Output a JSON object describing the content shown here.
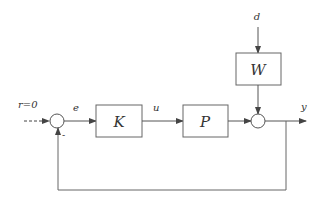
{
  "diagram": {
    "type": "feedback control block diagram",
    "blocks": [
      {
        "id": "K",
        "label": "K"
      },
      {
        "id": "P",
        "label": "P"
      },
      {
        "id": "W",
        "label": "W"
      }
    ],
    "signals": {
      "reference": "r=0",
      "error": "e",
      "control": "u",
      "disturbance": "d",
      "output": "y"
    },
    "feedback_sign": "-",
    "colors": {
      "stroke": "#555555",
      "text": "#333333"
    }
  }
}
